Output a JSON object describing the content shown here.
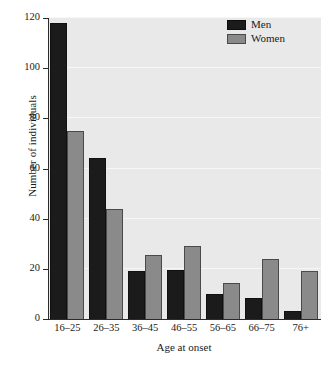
{
  "chart_data": {
    "type": "bar",
    "title": "",
    "subtitle": "",
    "xlabel": "Age at onset",
    "ylabel": "Number of individuals",
    "categories": [
      "16–25",
      "26–35",
      "36–45",
      "46–55",
      "56–65",
      "66–75",
      "76+"
    ],
    "series": [
      {
        "name": "Men",
        "color": "#1b1b1b",
        "values": [
          118,
          64,
          19,
          19.5,
          10,
          8.5,
          3
        ]
      },
      {
        "name": "Women",
        "color": "#8a8a8a",
        "values": [
          75,
          44,
          25.5,
          29,
          14.5,
          24,
          19
        ]
      }
    ],
    "ylim": [
      0,
      120
    ],
    "yticks": [
      0,
      20,
      40,
      60,
      80,
      100,
      120
    ],
    "ytick_labels": [
      "0",
      "20",
      "40",
      "60",
      "80",
      "100",
      "120"
    ],
    "grid": true,
    "grid_axis": "y",
    "grid_color": "#f7f7f7",
    "legend_position": "top-right",
    "plot_background": "#e9e9e9",
    "axis_color": "#2b2b2b"
  },
  "legend": {
    "entries": [
      {
        "label": "Men"
      },
      {
        "label": "Women"
      }
    ]
  }
}
